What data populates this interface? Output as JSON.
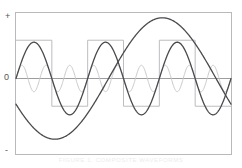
{
  "figure": {
    "background_color": "#ffffff",
    "caption": "FIGURE 1. COMPOSITE WAVEFORMS"
  },
  "axes": {
    "frame_color": "#b9b9bb",
    "zero_line_color": "#9d9da0",
    "labels": {
      "positive": "+",
      "zero": "0",
      "negative": "-"
    },
    "plot_box": {
      "left": 15,
      "top": 12,
      "right": 232,
      "bottom": 155
    }
  },
  "chart_data": {
    "type": "line",
    "title": "",
    "xlabel": "",
    "ylabel": "",
    "xlim": [
      0,
      1
    ],
    "ylim": [
      -1,
      1
    ],
    "grid": false,
    "legend": "none",
    "y_ticks": [
      "+",
      "0",
      "-"
    ],
    "zero_line": 0,
    "series": [
      {
        "name": "square-wave",
        "shape": "square",
        "color": "#bdbdc0",
        "width": 1,
        "cycles": 3,
        "amplitude": 0.58,
        "offset": 0,
        "phase_deg": 0,
        "description": "Light gray square wave, three full cycles, high level at +0.58, low level at -0.42 of full scale, starting high at the left edge"
      },
      {
        "name": "fast-sine-wave",
        "shape": "sine",
        "color": "#4a4a4e",
        "width": 1.3,
        "cycles": 3,
        "amplitude": 0.55,
        "offset": 0,
        "phase_deg": 0,
        "description": "Dark sine wave with three cycles across the frame, peaks near +0.55 and troughs near -0.55"
      },
      {
        "name": "high-frequency-sine-wave",
        "shape": "sine",
        "color": "#cacacd",
        "width": 1,
        "cycles": 9,
        "amplitude": 0.2,
        "offset": 0,
        "phase_deg": 0,
        "description": "Light gray low-amplitude sine, nine cycles, amplitude about 0.2 of full scale"
      },
      {
        "name": "slow-sine-wave",
        "shape": "sine",
        "color": "#4a4a4e",
        "width": 1.3,
        "cycles": 1,
        "amplitude": 0.92,
        "offset": 0,
        "phase_deg": 205,
        "description": "Dark low-frequency sine completing roughly one cycle, starting below zero, bottoming near -0.9 at about one quarter width and rising to near +0.9 at the right edge"
      }
    ]
  }
}
